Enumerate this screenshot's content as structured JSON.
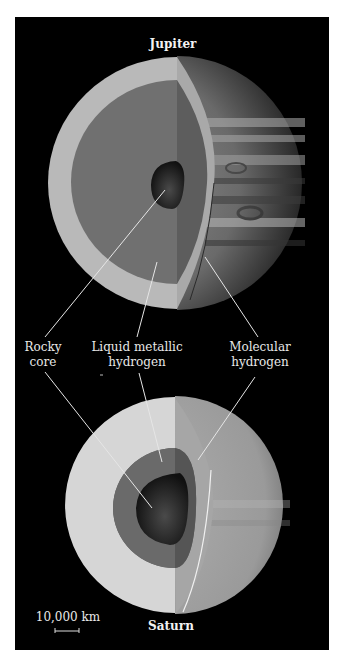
{
  "diagram": {
    "type": "cutaway-comparison",
    "planets": [
      {
        "name": "Jupiter",
        "layers": [
          "Rocky core",
          "Liquid metallic hydrogen",
          "Molecular hydrogen"
        ]
      },
      {
        "name": "Saturn",
        "layers": [
          "Rocky core",
          "Liquid metallic hydrogen",
          "Molecular hydrogen"
        ]
      }
    ],
    "labels": {
      "rocky_core": [
        "Rocky",
        "core"
      ],
      "liquid_metallic": [
        "Liquid metallic",
        "hydrogen"
      ],
      "molecular": [
        "Molecular",
        "hydrogen"
      ]
    },
    "scale_bar": {
      "label": "10,000 km"
    },
    "colors": {
      "background": "#000000",
      "jupiter_outer": "#b9b9b9",
      "jupiter_metallic": "#6e6e6e",
      "jupiter_core": "#222222",
      "saturn_outer": "#d6d6d6",
      "saturn_right": "#9c9c9c",
      "saturn_metallic": "#5f5f5f",
      "saturn_core": "#1e1e1e",
      "leader_line": "#e6e6e6"
    }
  }
}
